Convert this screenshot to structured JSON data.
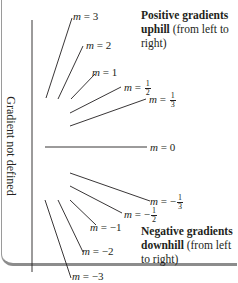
{
  "figure": {
    "vertical_axis_label": "Gradient not defined",
    "lines": [
      {
        "m": "3",
        "label_prefix": "m = ",
        "label_value": "3"
      },
      {
        "m": "2",
        "label_prefix": "m = ",
        "label_value": "2"
      },
      {
        "m": "1",
        "label_prefix": "m = ",
        "label_value": "1"
      },
      {
        "m": "1/2",
        "label_prefix": "m = ",
        "num": "1",
        "den": "2"
      },
      {
        "m": "1/3",
        "label_prefix": "m = ",
        "num": "1",
        "den": "3"
      },
      {
        "m": "0",
        "label_prefix": "m = ",
        "label_value": "0"
      },
      {
        "m": "-1/3",
        "label_prefix": "m = −",
        "num": "1",
        "den": "3"
      },
      {
        "m": "-1/2",
        "label_prefix": "m = −",
        "num": "1",
        "den": "2"
      },
      {
        "m": "-1",
        "label_prefix": "m = ",
        "label_value": "−1"
      },
      {
        "m": "-2",
        "label_prefix": "m = ",
        "label_value": "−2"
      },
      {
        "m": "-3",
        "label_prefix": "m = ",
        "label_value": "−3"
      }
    ],
    "positive_note": {
      "bold": "Positive gradients uphill",
      "rest": " (from left to right)"
    },
    "negative_note": {
      "bold": "Negative gradients downhill",
      "rest": " (from left to right)"
    },
    "line_color": "#231f20",
    "frame_color": "#8c8c8c"
  }
}
